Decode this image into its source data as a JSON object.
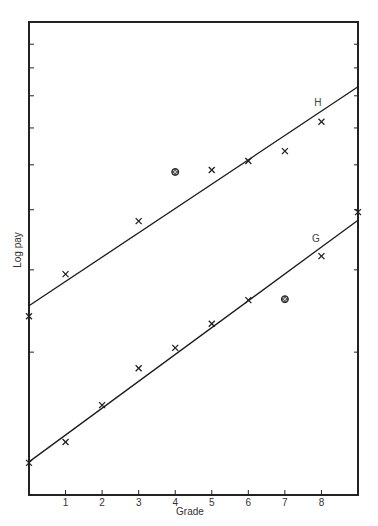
{
  "chart_data": {
    "type": "scatter",
    "title": "",
    "xlabel": "Grade",
    "ylabel": "Log pay",
    "x_ticks": [
      1,
      2,
      3,
      4,
      5,
      6,
      7,
      8
    ],
    "xlim": [
      0,
      9
    ],
    "ylim": [
      0,
      1
    ],
    "y_scale_note": "log scale, no numeric tick labels; values are normalized plot height (0=bottom, 1=top)",
    "y_ticks": [
      0.302,
      0.476,
      0.603,
      0.698,
      0.776,
      0.844,
      0.903,
      0.953
    ],
    "grid": false,
    "legend": "none (series labelled inline H and G)",
    "series": [
      {
        "name": "H",
        "label_pos": {
          "x": 7.9,
          "y": 0.83
        },
        "points": [
          {
            "x": 0,
            "y": 0.378,
            "marker": "x"
          },
          {
            "x": 1,
            "y": 0.467,
            "marker": "x"
          },
          {
            "x": 3,
            "y": 0.579,
            "marker": "x"
          },
          {
            "x": 4,
            "y": 0.683,
            "marker": "circled"
          },
          {
            "x": 5,
            "y": 0.687,
            "marker": "x"
          },
          {
            "x": 6,
            "y": 0.706,
            "marker": "x"
          },
          {
            "x": 7,
            "y": 0.727,
            "marker": "x"
          },
          {
            "x": 8,
            "y": 0.789,
            "marker": "x"
          }
        ],
        "fit_line": {
          "x0": 0,
          "y0": 0.4,
          "x1": 9,
          "y1": 0.863
        }
      },
      {
        "name": "G",
        "label_pos": {
          "x": 7.85,
          "y": 0.543
        },
        "points": [
          {
            "x": 0,
            "y": 0.068,
            "marker": "x"
          },
          {
            "x": 1,
            "y": 0.112,
            "marker": "x"
          },
          {
            "x": 2,
            "y": 0.19,
            "marker": "x"
          },
          {
            "x": 3,
            "y": 0.268,
            "marker": "x"
          },
          {
            "x": 4,
            "y": 0.311,
            "marker": "x"
          },
          {
            "x": 5,
            "y": 0.362,
            "marker": "x"
          },
          {
            "x": 6,
            "y": 0.412,
            "marker": "x"
          },
          {
            "x": 7,
            "y": 0.414,
            "marker": "circled"
          },
          {
            "x": 8,
            "y": 0.505,
            "marker": "x"
          },
          {
            "x": 9,
            "y": 0.598,
            "marker": "x"
          }
        ],
        "fit_line": {
          "x0": 0,
          "y0": 0.07,
          "x1": 9,
          "y1": 0.581
        }
      }
    ]
  }
}
